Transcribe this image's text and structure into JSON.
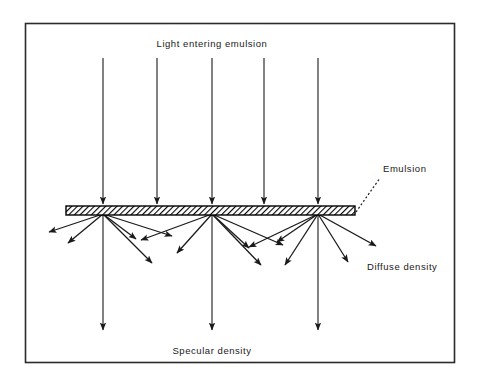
{
  "figure": {
    "type": "diagram",
    "frame": {
      "stroke_color": "#2b2b2b",
      "fill_color": "#ffffff",
      "x": 25,
      "y": 23,
      "width": 430,
      "height": 340
    },
    "labels": {
      "incoming": "Light entering emulsion",
      "emulsion": "Emulsion",
      "diffuse": "Diffuse density",
      "specular": "Specular density"
    },
    "label_positions": {
      "incoming": {
        "x": 212,
        "y": 47
      },
      "emulsion": {
        "x": 383,
        "y": 172
      },
      "diffuse": {
        "x": 367,
        "y": 270
      },
      "specular": {
        "x": 212,
        "y": 354
      }
    },
    "emulsion_bar": {
      "x": 66,
      "y": 206,
      "width": 289,
      "height": 9,
      "stroke_color": "#000000",
      "hatch_color": "#000000",
      "fill_color": "#ffffff",
      "hatch_angle_deg": 45
    },
    "leader_line": {
      "style": "dotted",
      "from": {
        "x": 356,
        "y": 212
      },
      "to": {
        "x": 380,
        "y": 178
      },
      "color": "#1a1a1a"
    },
    "incoming_rays": [
      {
        "x": 103,
        "y_start": 58,
        "y_end": 205
      },
      {
        "x": 157,
        "y_start": 58,
        "y_end": 205
      },
      {
        "x": 212,
        "y_start": 58,
        "y_end": 205
      },
      {
        "x": 264,
        "y_start": 58,
        "y_end": 205
      },
      {
        "x": 318,
        "y_start": 58,
        "y_end": 205
      }
    ],
    "specular_rays": [
      {
        "x": 103,
        "y_start": 215,
        "y_end": 331
      },
      {
        "x": 212,
        "y_start": 215,
        "y_end": 331
      },
      {
        "x": 318,
        "y_start": 215,
        "y_end": 331
      }
    ],
    "scatter_points": [
      {
        "x": 103,
        "y": 214
      },
      {
        "x": 212,
        "y": 214
      },
      {
        "x": 318,
        "y": 214
      }
    ],
    "diffuse_rays": [
      {
        "from": {
          "x": 103,
          "y": 214
        },
        "to": {
          "x": 49,
          "y": 232
        }
      },
      {
        "from": {
          "x": 103,
          "y": 214
        },
        "to": {
          "x": 68,
          "y": 243
        }
      },
      {
        "from": {
          "x": 103,
          "y": 214
        },
        "to": {
          "x": 136,
          "y": 239
        }
      },
      {
        "from": {
          "x": 103,
          "y": 214
        },
        "to": {
          "x": 152,
          "y": 263
        }
      },
      {
        "from": {
          "x": 103,
          "y": 214
        },
        "to": {
          "x": 172,
          "y": 236
        }
      },
      {
        "from": {
          "x": 212,
          "y": 214
        },
        "to": {
          "x": 141,
          "y": 240
        }
      },
      {
        "from": {
          "x": 212,
          "y": 214
        },
        "to": {
          "x": 177,
          "y": 253
        }
      },
      {
        "from": {
          "x": 212,
          "y": 214
        },
        "to": {
          "x": 249,
          "y": 248
        }
      },
      {
        "from": {
          "x": 212,
          "y": 214
        },
        "to": {
          "x": 261,
          "y": 265
        }
      },
      {
        "from": {
          "x": 212,
          "y": 214
        },
        "to": {
          "x": 283,
          "y": 245
        }
      },
      {
        "from": {
          "x": 318,
          "y": 214
        },
        "to": {
          "x": 249,
          "y": 247
        }
      },
      {
        "from": {
          "x": 318,
          "y": 214
        },
        "to": {
          "x": 277,
          "y": 242
        }
      },
      {
        "from": {
          "x": 318,
          "y": 214
        },
        "to": {
          "x": 285,
          "y": 265
        }
      },
      {
        "from": {
          "x": 318,
          "y": 214
        },
        "to": {
          "x": 348,
          "y": 262
        }
      },
      {
        "from": {
          "x": 318,
          "y": 214
        },
        "to": {
          "x": 376,
          "y": 246
        }
      }
    ],
    "colors": {
      "line": "#1a1a1a",
      "text": "#1a1a1a",
      "background": "#ffffff"
    }
  }
}
